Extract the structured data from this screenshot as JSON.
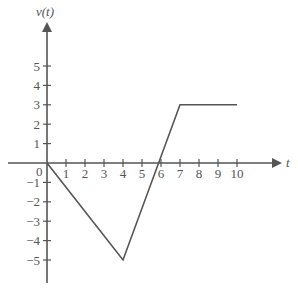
{
  "chart_data": {
    "type": "line",
    "title": "",
    "xlabel": "t",
    "ylabel": "v(t)",
    "x": [
      0,
      4,
      7,
      10
    ],
    "series": [
      {
        "name": "v(t)",
        "values": [
          0,
          -5,
          3,
          3
        ]
      }
    ],
    "x_ticks": [
      "1",
      "2",
      "3",
      "4",
      "5",
      "6",
      "7",
      "8",
      "9",
      "10"
    ],
    "y_ticks": [
      "5",
      "4",
      "3",
      "2",
      "1",
      "-1",
      "-2",
      "-3",
      "-4",
      "-5"
    ],
    "origin_label": "0",
    "xlim": [
      -2,
      11
    ],
    "ylim": [
      -6,
      7
    ],
    "grid": false,
    "legend": "none"
  }
}
